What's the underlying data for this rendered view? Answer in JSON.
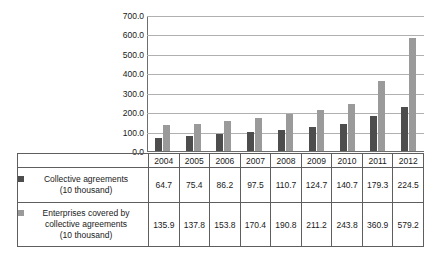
{
  "chart_data": {
    "type": "bar",
    "title": "",
    "xlabel": "",
    "ylabel": "",
    "categories": [
      "2004",
      "2005",
      "2006",
      "2007",
      "2008",
      "2009",
      "2010",
      "2011",
      "2012"
    ],
    "series": [
      {
        "name": "Collective agreements (10 thousand)",
        "color": "#4d4d4d",
        "values": [
          64.7,
          75.4,
          86.2,
          97.5,
          110.7,
          124.7,
          140.7,
          179.3,
          224.5
        ]
      },
      {
        "name": "Enterprises covered by collective agreements (10 thousand)",
        "color": "#9a9a9a",
        "values": [
          135.9,
          137.8,
          153.8,
          170.4,
          190.8,
          211.2,
          243.8,
          360.9,
          579.2
        ]
      }
    ],
    "ylim": [
      0,
      700
    ],
    "ytick_labels": [
      "700.0",
      "600.0",
      "500.0",
      "400.0",
      "300.0",
      "200.0",
      "100.0",
      "0.0"
    ],
    "ytick_values": [
      700,
      600,
      500,
      400,
      300,
      200,
      100,
      0
    ],
    "grid": true,
    "legend_position": "table-below"
  },
  "table": {
    "year_row": {
      "label": "",
      "cells": [
        "2004",
        "2005",
        "2006",
        "2007",
        "2008",
        "2009",
        "2010",
        "2011",
        "2012"
      ]
    },
    "rows": [
      {
        "swatch": "series-a-swatch",
        "label_line1": "Collective agreements",
        "label_line2": "(10 thousand)",
        "label_line3": "",
        "cells": [
          "64.7",
          "75.4",
          "86.2",
          "97.5",
          "110.7",
          "124.7",
          "140.7",
          "179.3",
          "224.5"
        ]
      },
      {
        "swatch": "series-b-swatch",
        "label_line1": "Enterprises covered by",
        "label_line2": "collective agreements",
        "label_line3": "(10 thousand)",
        "cells": [
          "135.9",
          "137.8",
          "153.8",
          "170.4",
          "190.8",
          "211.2",
          "243.8",
          "360.9",
          "579.2"
        ]
      }
    ]
  },
  "colors": {
    "series_a": "#4d4d4d",
    "series_b": "#9a9a9a",
    "gridline": "#b0b0b0",
    "axis": "#6e6e6e",
    "border": "#5e5e5e"
  }
}
